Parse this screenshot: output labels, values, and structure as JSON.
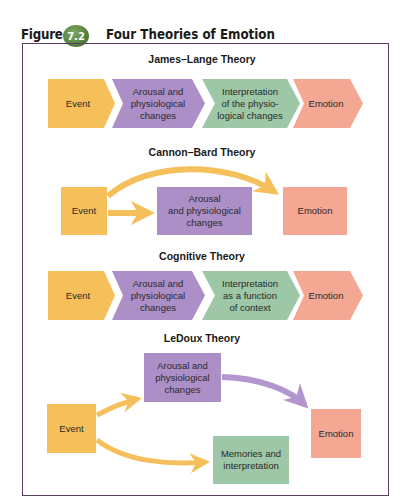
{
  "figure": {
    "label": "Figure",
    "number": "7.2",
    "title": "Four Theories of Emotion",
    "colors": {
      "event": "#f5bf5a",
      "arousal": "#ad8fc8",
      "interpretation": "#9dc7a6",
      "emotion": "#f4a793",
      "arrow_yellow": "#f5c05c",
      "arrow_purple": "#b396cf",
      "frame": "#5a3d63",
      "badge": "#5a8444"
    }
  },
  "theories": [
    {
      "title": "James–Lange Theory",
      "steps": [
        "Event",
        "Arousal and physiological changes",
        "Interpretation of the physio- logical changes",
        "Emotion"
      ]
    },
    {
      "title": "Cannon–Bard Theory",
      "steps": [
        "Event",
        "Arousal and physiological changes",
        "Emotion"
      ]
    },
    {
      "title": "Cognitive Theory",
      "steps": [
        "Event",
        "Arousal and physiological changes",
        "Interpretation as a function of context",
        "Emotion"
      ]
    },
    {
      "title": "LeDoux Theory",
      "steps": [
        "Event",
        "Arousal and physiological changes",
        "Memories and interpretation",
        "Emotion"
      ]
    }
  ],
  "labels": {
    "jl_event": "Event",
    "jl_arousal_1": "Arousal and",
    "jl_arousal_2": "physiological",
    "jl_arousal_3": "changes",
    "jl_interp_1": "Interpretation",
    "jl_interp_2": "of the physio-",
    "jl_interp_3": "logical changes",
    "jl_emotion": "Emotion",
    "cb_event": "Event",
    "cb_arousal_1": "Arousal",
    "cb_arousal_2": "and physiological",
    "cb_arousal_3": "changes",
    "cb_emotion": "Emotion",
    "cg_event": "Event",
    "cg_arousal_1": "Arousal and",
    "cg_arousal_2": "physiological",
    "cg_arousal_3": "changes",
    "cg_interp_1": "Interpretation",
    "cg_interp_2": "as a function",
    "cg_interp_3": "of context",
    "cg_emotion": "Emotion",
    "ld_event": "Event",
    "ld_arousal_1": "Arousal and",
    "ld_arousal_2": "physiological",
    "ld_arousal_3": "changes",
    "ld_memories_1": "Memories and",
    "ld_memories_2": "interpretation",
    "ld_emotion": "Emotion"
  }
}
